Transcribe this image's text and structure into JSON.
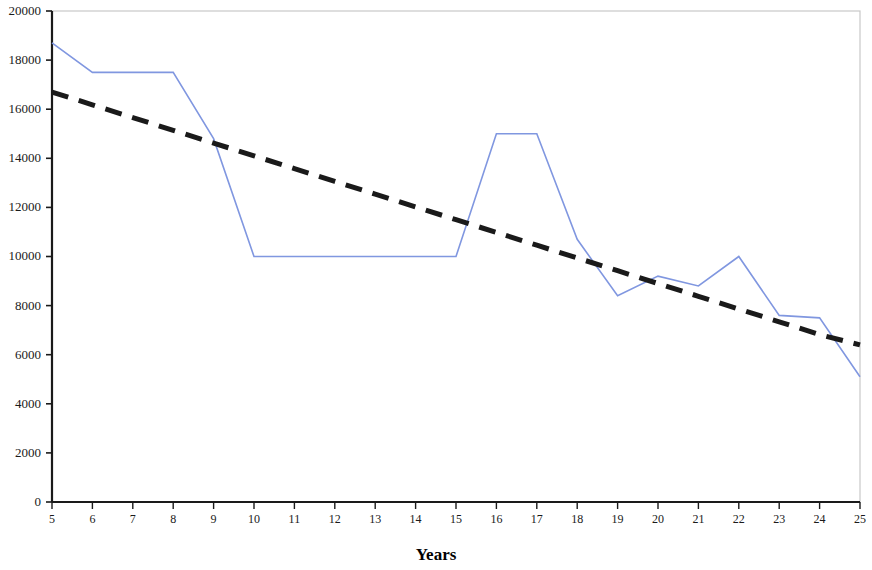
{
  "chart_data": {
    "type": "line",
    "title": "",
    "subtitle": "",
    "xlabel": "Years",
    "ylabel": "",
    "xlim": [
      5,
      25
    ],
    "ylim": [
      0,
      20000
    ],
    "grid": false,
    "legend": "none",
    "x": [
      5,
      6,
      7,
      8,
      9,
      10,
      11,
      12,
      13,
      14,
      15,
      16,
      17,
      18,
      19,
      20,
      21,
      22,
      23,
      24,
      25
    ],
    "xticks": [
      "5",
      "6",
      "7",
      "8",
      "9",
      "10",
      "11",
      "12",
      "13",
      "14",
      "15",
      "16",
      "17",
      "18",
      "19",
      "20",
      "21",
      "22",
      "23",
      "24",
      "25"
    ],
    "yticks": [
      "0",
      "2000",
      "4000",
      "6000",
      "8000",
      "10000",
      "12000",
      "14000",
      "16000",
      "18000",
      "20000"
    ],
    "ytick_values": [
      0,
      2000,
      4000,
      6000,
      8000,
      10000,
      12000,
      14000,
      16000,
      18000,
      20000
    ],
    "series": [
      {
        "name": "data",
        "style": "solid",
        "color": "#8097e0",
        "values": [
          18700,
          17500,
          17500,
          17500,
          14800,
          10000,
          10000,
          10000,
          10000,
          10000,
          10000,
          15000,
          15000,
          10700,
          8400,
          9200,
          8800,
          10000,
          7600,
          7500,
          5100
        ]
      },
      {
        "name": "trendline",
        "style": "dashed",
        "color": "#1a1a1a",
        "values": [
          16700,
          16180,
          15660,
          15140,
          14620,
          14100,
          13580,
          13060,
          12540,
          12020,
          11500,
          10980,
          10460,
          9940,
          9420,
          8900,
          8380,
          7860,
          7340,
          6820,
          6400
        ]
      }
    ]
  },
  "colors": {
    "series_line": "#8097e0",
    "trend_line": "#1a1a1a",
    "axis": "#1a1a1a",
    "frame": "#c8c8c8",
    "background": "#ffffff"
  },
  "axis_title": "Years"
}
